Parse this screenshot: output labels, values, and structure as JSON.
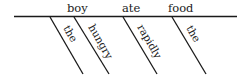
{
  "diagram": {
    "type": "reed-kellogg-sentence-diagram",
    "baseline": {
      "subject": "boy",
      "verb": "ate",
      "object": "food"
    },
    "modifiers": [
      {
        "word": "the",
        "modifies": "boy"
      },
      {
        "word": "hungry",
        "modifies": "boy"
      },
      {
        "word": "rapidly",
        "modifies": "ate"
      },
      {
        "word": "the",
        "modifies": "food"
      }
    ],
    "colors": {
      "ink": "#1a1a1a",
      "background": "#ffffff"
    }
  }
}
